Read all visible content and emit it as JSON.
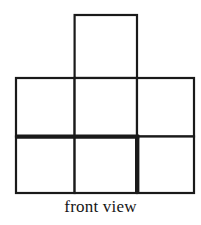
{
  "figure": {
    "caption": "front view",
    "background_color": "#ffffff",
    "line_color": "#1a1a1a",
    "fill_color": "#ffffff",
    "thin_stroke_width": 2.2,
    "bold_stroke_width": 4.4,
    "grid": {
      "columns": 3,
      "rows": 2,
      "left": 16,
      "top": 78,
      "right": 194,
      "bottom": 193,
      "cell_width": 59.3,
      "cell_height": 57.5,
      "column_dividers_x": [
        74.6,
        137.0
      ],
      "row_divider_y": 136.5
    },
    "top_square": {
      "left": 74.6,
      "top": 15,
      "right": 137.0,
      "bottom": 78,
      "column_index": 1
    },
    "emphasized_segments": [
      {
        "name": "middle-horizontal-left",
        "orientation": "horizontal",
        "x1": 16,
        "y1": 136.5,
        "x2": 137.0,
        "y2": 136.5
      },
      {
        "name": "bottom-row-right-vertical",
        "orientation": "vertical",
        "x1": 137.0,
        "y1": 136.5,
        "x2": 137.0,
        "y2": 193
      }
    ],
    "squares": [
      {
        "name": "top-middle-square",
        "row": -1,
        "col": 1
      },
      {
        "name": "upper-left-square",
        "row": 0,
        "col": 0
      },
      {
        "name": "upper-middle-square",
        "row": 0,
        "col": 1
      },
      {
        "name": "upper-right-square",
        "row": 0,
        "col": 2
      },
      {
        "name": "lower-left-square",
        "row": 1,
        "col": 0
      },
      {
        "name": "lower-middle-square",
        "row": 1,
        "col": 1
      },
      {
        "name": "lower-right-square",
        "row": 1,
        "col": 2
      }
    ]
  }
}
